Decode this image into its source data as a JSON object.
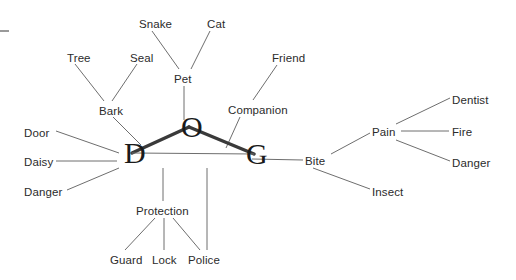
{
  "diagram": {
    "background_color": "#ffffff",
    "edge_color": "#6e6e6e",
    "core_edge_color": "#3a3a3a",
    "label_color": "#2b2b2b",
    "core_label_color": "#1a1a1a",
    "corner_mark": "dash",
    "core_nodes": [
      {
        "id": "D",
        "label": "D",
        "x": 124,
        "y": 162
      },
      {
        "id": "O",
        "label": "O",
        "x": 181,
        "y": 136
      },
      {
        "id": "G",
        "label": "G",
        "x": 246,
        "y": 163
      }
    ],
    "core_edges": [
      {
        "from": "D",
        "to": "O",
        "weight": "thick"
      },
      {
        "from": "O",
        "to": "G",
        "weight": "thick"
      },
      {
        "from": "D",
        "to": "G",
        "weight": "thin"
      }
    ],
    "nodes": [
      {
        "id": "tree",
        "label": "Tree",
        "x": 67,
        "y": 52,
        "anchor": "left"
      },
      {
        "id": "seal",
        "label": "Seal",
        "x": 130,
        "y": 52,
        "anchor": "left"
      },
      {
        "id": "snake",
        "label": "Snake",
        "x": 139,
        "y": 18,
        "anchor": "left"
      },
      {
        "id": "cat",
        "label": "Cat",
        "x": 207,
        "y": 18,
        "anchor": "left"
      },
      {
        "id": "friend",
        "label": "Friend",
        "x": 272,
        "y": 52,
        "anchor": "left"
      },
      {
        "id": "bark",
        "label": "Bark",
        "x": 99,
        "y": 105,
        "anchor": "left"
      },
      {
        "id": "pet",
        "label": "Pet",
        "x": 174,
        "y": 73,
        "anchor": "left"
      },
      {
        "id": "companion",
        "label": "Companion",
        "x": 228,
        "y": 104,
        "anchor": "left"
      },
      {
        "id": "door",
        "label": "Door",
        "x": 24,
        "y": 127,
        "anchor": "left"
      },
      {
        "id": "daisy",
        "label": "Daisy",
        "x": 24,
        "y": 156,
        "anchor": "left"
      },
      {
        "id": "danger_d",
        "label": "Danger",
        "x": 24,
        "y": 186,
        "anchor": "left"
      },
      {
        "id": "protection",
        "label": "Protection",
        "x": 136,
        "y": 205,
        "anchor": "left"
      },
      {
        "id": "guard",
        "label": "Guard",
        "x": 110,
        "y": 254,
        "anchor": "left"
      },
      {
        "id": "lock",
        "label": "Lock",
        "x": 152,
        "y": 254,
        "anchor": "left"
      },
      {
        "id": "police",
        "label": "Police",
        "x": 188,
        "y": 254,
        "anchor": "left"
      },
      {
        "id": "bite",
        "label": "Bite",
        "x": 305,
        "y": 155,
        "anchor": "left"
      },
      {
        "id": "pain",
        "label": "Pain",
        "x": 372,
        "y": 126,
        "anchor": "left"
      },
      {
        "id": "insect",
        "label": "Insect",
        "x": 372,
        "y": 186,
        "anchor": "left"
      },
      {
        "id": "dentist",
        "label": "Dentist",
        "x": 452,
        "y": 94,
        "anchor": "left"
      },
      {
        "id": "fire",
        "label": "Fire",
        "x": 452,
        "y": 126,
        "anchor": "left"
      },
      {
        "id": "danger_p",
        "label": "Danger",
        "x": 452,
        "y": 157,
        "anchor": "left"
      }
    ],
    "edges": [
      {
        "from": "tree",
        "to": "bark",
        "x1": 75,
        "y1": 64,
        "x2": 104,
        "y2": 101
      },
      {
        "from": "seal",
        "to": "bark",
        "x1": 137,
        "y1": 64,
        "x2": 112,
        "y2": 101
      },
      {
        "from": "bark",
        "to": "D",
        "x1": 113,
        "y1": 117,
        "x2": 141,
        "y2": 145
      },
      {
        "from": "snake",
        "to": "pet",
        "x1": 152,
        "y1": 31,
        "x2": 179,
        "y2": 69
      },
      {
        "from": "cat",
        "to": "pet",
        "x1": 210,
        "y1": 31,
        "x2": 191,
        "y2": 69
      },
      {
        "from": "pet",
        "to": "O",
        "x1": 184,
        "y1": 86,
        "x2": 184,
        "y2": 120
      },
      {
        "from": "friend",
        "to": "companion",
        "x1": 277,
        "y1": 65,
        "x2": 253,
        "y2": 100
      },
      {
        "from": "companion",
        "to": "G",
        "x1": 240,
        "y1": 117,
        "x2": 226,
        "y2": 148
      },
      {
        "from": "door",
        "to": "D",
        "x1": 56,
        "y1": 131,
        "x2": 119,
        "y2": 153
      },
      {
        "from": "daisy",
        "to": "D",
        "x1": 56,
        "y1": 161,
        "x2": 117,
        "y2": 161
      },
      {
        "from": "danger_d",
        "to": "D",
        "x1": 67,
        "y1": 190,
        "x2": 119,
        "y2": 168
      },
      {
        "from": "edge_dg",
        "to": "protection",
        "x1": 163,
        "y1": 168,
        "x2": 163,
        "y2": 201
      },
      {
        "from": "edge_dg",
        "to": "police",
        "x1": 207,
        "y1": 168,
        "x2": 207,
        "y2": 250
      },
      {
        "from": "protection",
        "to": "guard",
        "x1": 155,
        "y1": 218,
        "x2": 125,
        "y2": 250
      },
      {
        "from": "protection",
        "to": "lock",
        "x1": 164,
        "y1": 218,
        "x2": 164,
        "y2": 250
      },
      {
        "from": "protection",
        "to": "police",
        "x1": 173,
        "y1": 218,
        "x2": 200,
        "y2": 250
      },
      {
        "from": "G",
        "to": "bite",
        "x1": 252,
        "y1": 159,
        "x2": 303,
        "y2": 160
      },
      {
        "from": "bite",
        "to": "pain",
        "x1": 331,
        "y1": 154,
        "x2": 370,
        "y2": 133
      },
      {
        "from": "bite",
        "to": "insect",
        "x1": 313,
        "y1": 168,
        "x2": 370,
        "y2": 189
      },
      {
        "from": "pain",
        "to": "dentist",
        "x1": 396,
        "y1": 124,
        "x2": 450,
        "y2": 98
      },
      {
        "from": "pain",
        "to": "fire",
        "x1": 401,
        "y1": 131,
        "x2": 449,
        "y2": 131
      },
      {
        "from": "pain",
        "to": "danger_p",
        "x1": 396,
        "y1": 140,
        "x2": 450,
        "y2": 161
      }
    ]
  }
}
